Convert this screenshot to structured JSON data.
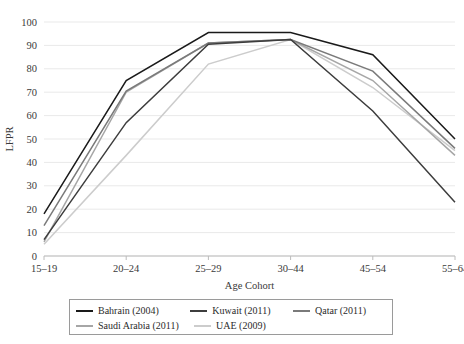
{
  "chart_data": {
    "type": "line",
    "title": "",
    "xlabel": "Age Cohort",
    "ylabel": "LFPR",
    "categories": [
      "15–19",
      "20–24",
      "25–29",
      "30–44",
      "45–54",
      "55–64"
    ],
    "ylim": [
      0,
      100
    ],
    "yticks": [
      0,
      10,
      20,
      30,
      40,
      50,
      60,
      70,
      80,
      90,
      100
    ],
    "grid": true,
    "legend_position": "bottom",
    "series": [
      {
        "name": "Bahrain (2004)",
        "color": "#1a1a1a",
        "values": [
          18,
          75,
          95.5,
          95.5,
          86,
          50
        ]
      },
      {
        "name": "Kuwait (2011)",
        "color": "#3d3d3d",
        "values": [
          7,
          57,
          90.5,
          92.5,
          62,
          23
        ]
      },
      {
        "name": "Qatar (2011)",
        "color": "#7a7a7a",
        "values": [
          13,
          70.5,
          91,
          92.5,
          79,
          46
        ]
      },
      {
        "name": "Saudi Arabia (2011)",
        "color": "#a6a6a6",
        "values": [
          6,
          70,
          91,
          92.5,
          75,
          43
        ]
      },
      {
        "name": "UAE (2009)",
        "color": "#cccccc",
        "values": [
          5,
          43,
          82,
          92.5,
          72,
          45
        ]
      }
    ]
  },
  "legend": {
    "rows": [
      [
        {
          "label": "Bahrain (2004)",
          "color": "#1a1a1a"
        },
        {
          "label": "Kuwait (2011)",
          "color": "#3d3d3d"
        },
        {
          "label": "Qatar (2011)",
          "color": "#7a7a7a"
        }
      ],
      [
        {
          "label": "Saudi Arabia (2011)",
          "color": "#a6a6a6"
        },
        {
          "label": "UAE (2009)",
          "color": "#cccccc"
        }
      ]
    ]
  }
}
